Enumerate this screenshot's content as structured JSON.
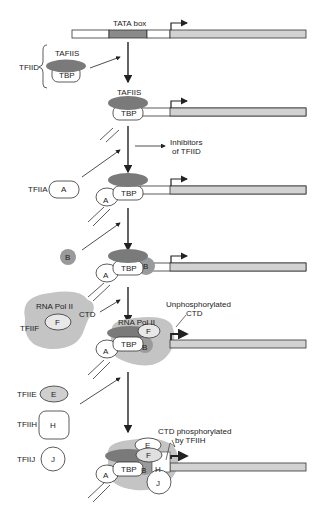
{
  "figure": {
    "colors": {
      "dna_line": "#333333",
      "tata_box": "#8a8a8a",
      "gene_body": "#d2d2d2",
      "tafs": "#7a7a7a",
      "tfiib": "#9a9a9a",
      "pol2_blob": "#c4c4c4",
      "tfiie": "#cfcfcf",
      "white_factor": "#ffffff"
    }
  },
  "labels": {
    "tata_box": "TATA box",
    "tfiid": "TFIID",
    "tafs_free": "TAFIIS",
    "tbp_free": "TBP",
    "tafs_bound": "TAFIIS",
    "tbp_s2": "TBP",
    "inhibitors_line1": "Inhibitors",
    "inhibitors_line2": "of TFIID",
    "tfiia": "TFIIA",
    "a_free": "A",
    "a_s3": "A",
    "tbp_s3": "TBP",
    "b_free": "B",
    "a_s4": "A",
    "tbp_s4": "TBP",
    "b_s4": "B",
    "rna_pol_free": "RNA Pol II",
    "f_free": "F",
    "ctd_free": "CTD",
    "tfiif": "TFIIF",
    "unphos_line1": "Unphosphorylated",
    "unphos_line2": "CTD",
    "rna_pol_s5": "RNA Pol II",
    "f_s5": "F",
    "a_s5": "A",
    "tbp_s5": "TBP",
    "b_s5": "B",
    "tfiie": "TFIIE",
    "e_free": "E",
    "tfiih": "TFIIH",
    "h_free": "H",
    "tfiij": "TFIIJ",
    "j_free": "J",
    "ctd_phos_line1": "CTD phosphorylated",
    "ctd_phos_line2": "by TFIIH",
    "e_s6": "E",
    "f_s6": "F",
    "a_s6": "A",
    "tbp_s6": "TBP",
    "b_s6": "B",
    "h_s6": "H",
    "j_s6": "J"
  }
}
